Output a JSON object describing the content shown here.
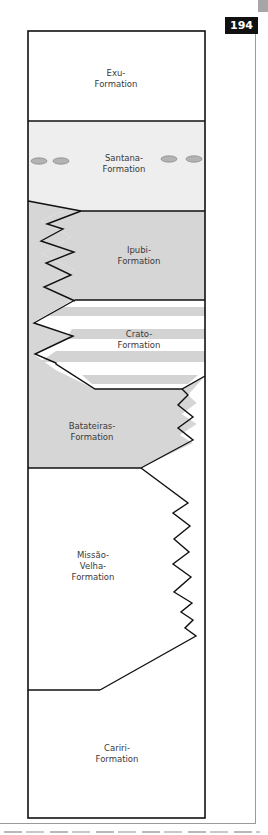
{
  "page": {
    "number": "194",
    "corner_tab_color": "#a6a6a6"
  },
  "diagram": {
    "colors": {
      "outline": "#111111",
      "gray_fill": "#d6d6d6",
      "light_fill": "#eeeeee",
      "white_fill": "#ffffff",
      "stripe_fill": "#d3d3d3",
      "nodule_fill": "#b3b3b3",
      "label_color": "#3a3a3a"
    },
    "formations": [
      {
        "id": "exu",
        "line1": "Exu-",
        "line2": "Formation",
        "line3": ""
      },
      {
        "id": "santana",
        "line1": "Santana-",
        "line2": "Formation",
        "line3": ""
      },
      {
        "id": "ipubi",
        "line1": "Ipubi-",
        "line2": "Formation",
        "line3": ""
      },
      {
        "id": "crato",
        "line1": "Crato-",
        "line2": "Formation",
        "line3": ""
      },
      {
        "id": "batateiras",
        "line1": "Batateiras-",
        "line2": "Formation",
        "line3": ""
      },
      {
        "id": "missao_velha",
        "line1": "Missão-",
        "line2": "Velha-",
        "line3": "Formation"
      },
      {
        "id": "cariri",
        "line1": "Cariri-",
        "line2": "Formation",
        "line3": ""
      }
    ],
    "santana_nodules": 4
  }
}
